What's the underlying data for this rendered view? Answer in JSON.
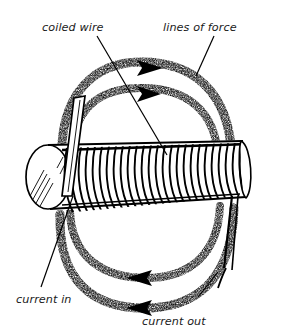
{
  "figure": {
    "background_color": "#ffffff",
    "ink_color": "#000000",
    "text_color": "#1a1a1a"
  },
  "labels": {
    "coiled_wire": "coiled wire",
    "lines_of_force": "lines of force",
    "current_in": "current in",
    "current_out": "current out"
  },
  "diagram": {
    "core": {
      "name": "cylindrical iron core",
      "end_cap_shading": "diagonal hatch lines"
    },
    "coil": {
      "name": "coiled wire winding",
      "turn_count": 26
    },
    "field_loops": [
      {
        "position": "upper-outer",
        "arrow_direction": "right"
      },
      {
        "position": "upper-inner",
        "arrow_direction": "right"
      },
      {
        "position": "lower-inner",
        "arrow_direction": "left"
      },
      {
        "position": "lower-outer",
        "arrow_direction": "left"
      }
    ],
    "leads": [
      {
        "name": "current-in-lead",
        "side": "left"
      },
      {
        "name": "current-out-lead",
        "side": "right"
      }
    ]
  }
}
